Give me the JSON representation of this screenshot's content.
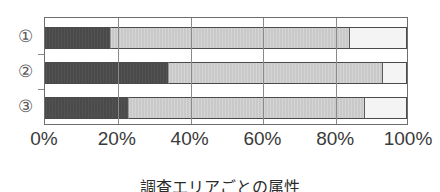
{
  "chart_data": {
    "type": "bar",
    "orientation": "horizontal",
    "stacked": true,
    "stacked_normalized": true,
    "title": "",
    "subtitle": "",
    "caption": "調査エリアごとの属性",
    "xlabel": "",
    "ylabel": "",
    "categories": [
      "①",
      "②",
      "③"
    ],
    "category_labels": [
      "①",
      "②",
      "③"
    ],
    "xlim": [
      0,
      100
    ],
    "xticks": [
      0,
      20,
      40,
      60,
      80,
      100
    ],
    "xtick_labels": [
      "0%",
      "20%",
      "40%",
      "60%",
      "80%",
      "100%"
    ],
    "grid": true,
    "grid_axis": "x",
    "legend": "none",
    "series": [
      {
        "name": "segment-1",
        "color": "#4a4a4a",
        "values": [
          18,
          34,
          23
        ]
      },
      {
        "name": "segment-2",
        "color": "#c9c9c9",
        "values": [
          66,
          59,
          65
        ]
      },
      {
        "name": "segment-3",
        "color": "#f4f4f4",
        "values": [
          16,
          7,
          12
        ]
      }
    ],
    "cumulative_boundaries": [
      [
        18,
        84
      ],
      [
        34,
        93
      ],
      [
        23,
        88
      ]
    ]
  },
  "axis": {
    "tick_labels": [
      "0%",
      "20%",
      "40%",
      "60%",
      "80%",
      "100%"
    ]
  },
  "rows": [
    {
      "label": "①",
      "segments": [
        18,
        66,
        16
      ]
    },
    {
      "label": "②",
      "segments": [
        34,
        59,
        7
      ]
    },
    {
      "label": "③",
      "segments": [
        23,
        65,
        12
      ]
    }
  ],
  "colors": {
    "segment_dark": "#4a4a4a",
    "segment_gray": "#c9c9c9",
    "segment_white": "#f4f4f4",
    "frame": "#6e6e6e",
    "text": "#2b2b2b"
  },
  "caption": "調査エリアごとの属性"
}
